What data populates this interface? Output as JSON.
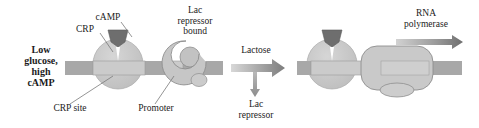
{
  "figure": {
    "colors": {
      "dna_dark": "#a8a8a8",
      "dna_light": "#cfcfcf",
      "protein_fill": "#c6c6c6",
      "protein_stroke": "#8e8e8e",
      "camp_dark": "#6e6e6e",
      "arrow_gray": "#8f8f8f",
      "text": "#1b1b1b",
      "leader_line": "#7a7a7a",
      "background": "#ffffff"
    }
  },
  "left_panel": {
    "condition_label": "Low\nglucose,\nhigh\ncAMP",
    "camp_label": "cAMP",
    "crp_label": "CRP",
    "repressor_label": "Lac\nrepressor\nbound",
    "crp_site_label": "CRP site",
    "promoter_label": "Promoter"
  },
  "transition": {
    "lactose_label": "Lactose",
    "released_repressor_label": "Lac\nrepressor",
    "arrow_right_icon": "right-arrow",
    "arrow_down_icon": "down-arrow"
  },
  "right_panel": {
    "rna_polymerase_label": "RNA\npolymerase",
    "transcription_arrow_icon": "right-arrow"
  }
}
